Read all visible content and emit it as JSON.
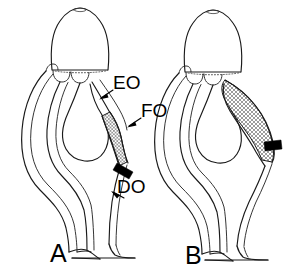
{
  "figure": {
    "width": 287,
    "height": 274,
    "background_color": "#ffffff",
    "line_color": "#1a1a1a",
    "type": "scientific-line-drawing"
  },
  "panels": [
    {
      "id": "A",
      "label": "A",
      "stipple_note": "narrow elongate cross-hatched region along the right duct"
    },
    {
      "id": "B",
      "label": "B",
      "stipple_note": "broad expanded cross-hatched region occupying the right flank"
    }
  ],
  "annotations": [
    {
      "id": "EO",
      "label": "EO",
      "description": "leader line pointing down-left to the upper right duct of panel A"
    },
    {
      "id": "FO",
      "label": "FO",
      "description": "leader line pointing down-left to the cross-hatched region of panel A"
    },
    {
      "id": "DO",
      "label": "DO",
      "description": "leader line pointing up-left to the lower right duct of panel A"
    }
  ],
  "markers": [
    {
      "id": "arrowhead-a",
      "name": "solid-arrowhead",
      "panel": "A",
      "description": "solid black arrowhead at the lower boundary of the cross-hatched region"
    },
    {
      "id": "arrowhead-b",
      "name": "solid-arrowhead",
      "panel": "B",
      "description": "solid black arrowhead at the lower boundary of the cross-hatched region"
    }
  ]
}
